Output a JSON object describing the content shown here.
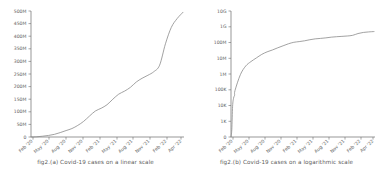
{
  "figure": {
    "background_color": "#ffffff",
    "line_color": "#8a8a8a",
    "axis_color": "#6b6b6b",
    "text_color": "#5e5e5e"
  },
  "panels": [
    {
      "id": "panel-a",
      "caption": "fig2.(a) Covid-19 cases on a linear scale"
    },
    {
      "id": "panel-b",
      "caption": "fig2.(b) Covid-19 cases on a logarithmic scale"
    }
  ],
  "chart_data": [
    {
      "type": "line",
      "title": "",
      "subtitle": "",
      "caption": "fig2.(a) Covid-19 cases on a linear scale",
      "xlabel": "",
      "ylabel": "",
      "yscale": "linear",
      "xscale": "time",
      "grid": false,
      "legend": "none",
      "ylim": [
        0,
        500000000
      ],
      "ytick_labels": [
        "0",
        "50M",
        "100M",
        "150M",
        "200M",
        "250M",
        "300M",
        "350M",
        "400M",
        "450M",
        "500M"
      ],
      "ytick_values": [
        0,
        50000000,
        100000000,
        150000000,
        200000000,
        250000000,
        300000000,
        350000000,
        400000000,
        450000000,
        500000000
      ],
      "xtick_labels": [
        "Feb '20",
        "May '20",
        "Aug '20",
        "Nov '20",
        "Feb '21",
        "May '21",
        "Aug '21",
        "Nov '21",
        "Feb '22",
        "Apr '22"
      ],
      "series": [
        {
          "name": "Covid-19 cumulative cases",
          "x": [
            "Feb '20",
            "Mar '20",
            "Apr '20",
            "May '20",
            "Jun '20",
            "Jul '20",
            "Aug '20",
            "Sep '20",
            "Oct '20",
            "Nov '20",
            "Dec '20",
            "Jan '21",
            "Feb '21",
            "Mar '21",
            "Apr '21",
            "May '21",
            "Jun '21",
            "Jul '21",
            "Aug '21",
            "Sep '21",
            "Oct '21",
            "Nov '21",
            "Dec '21",
            "Jan '22",
            "Feb '22",
            "Mar '22",
            "Apr '22"
          ],
          "values": [
            90000,
            900000,
            3200000,
            6200000,
            10500000,
            17500000,
            25500000,
            33500000,
            46000000,
            62000000,
            83000000,
            103000000,
            114000000,
            128000000,
            150000000,
            170000000,
            182000000,
            197000000,
            218000000,
            233000000,
            245000000,
            259000000,
            285000000,
            370000000,
            435000000,
            470000000,
            495000000
          ]
        }
      ]
    },
    {
      "type": "line",
      "title": "",
      "subtitle": "",
      "caption": "fig2.(b) Covid-19 cases on a logarithmic scale",
      "xlabel": "",
      "ylabel": "",
      "yscale": "log",
      "xscale": "time",
      "grid": false,
      "legend": "none",
      "ylim": [
        0,
        10000000000
      ],
      "ytick_labels": [
        "0",
        "1K",
        "10K",
        "100K",
        "1M",
        "10M",
        "100M",
        "1G",
        "10G"
      ],
      "ytick_values": [
        0,
        1000,
        10000,
        100000,
        1000000,
        10000000,
        100000000,
        1000000000,
        10000000000
      ],
      "xtick_labels": [
        "Feb '20",
        "May '20",
        "Aug '20",
        "Nov '20",
        "Feb '21",
        "May '21",
        "Aug '21",
        "Nov '21",
        "Feb '22",
        "Apr '22"
      ],
      "series": [
        {
          "name": "Covid-19 cumulative cases",
          "x": [
            "Feb '20",
            "Mar '20",
            "Apr '20",
            "May '20",
            "Jun '20",
            "Jul '20",
            "Aug '20",
            "Sep '20",
            "Oct '20",
            "Nov '20",
            "Dec '20",
            "Jan '21",
            "Feb '21",
            "Mar '21",
            "Apr '21",
            "May '21",
            "Jun '21",
            "Jul '21",
            "Aug '21",
            "Sep '21",
            "Oct '21",
            "Nov '21",
            "Dec '21",
            "Jan '22",
            "Feb '22",
            "Mar '22",
            "Apr '22"
          ],
          "values": [
            90000,
            900000,
            3200000,
            6200000,
            10500000,
            17500000,
            25500000,
            33500000,
            46000000,
            62000000,
            83000000,
            103000000,
            114000000,
            128000000,
            150000000,
            170000000,
            182000000,
            197000000,
            218000000,
            233000000,
            245000000,
            259000000,
            285000000,
            370000000,
            435000000,
            470000000,
            495000000
          ]
        }
      ]
    }
  ]
}
